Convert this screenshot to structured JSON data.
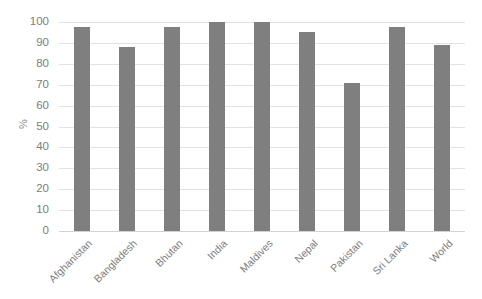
{
  "chart_data": {
    "type": "bar",
    "title": "",
    "subtitle": "",
    "xlabel": "",
    "ylabel": "%",
    "ylim": [
      0,
      100
    ],
    "ytick_step": 10,
    "yticks": [
      "100",
      "90",
      "80",
      "70",
      "60",
      "50",
      "40",
      "30",
      "20",
      "10",
      "0"
    ],
    "grid": true,
    "legend": false,
    "legend_position": "none",
    "bar_color": "#7f7f7f",
    "gridline_color": "#e2e2e2",
    "tick_label_color": "#7d7d7d",
    "categories": [
      "Afghanistan",
      "Bangladesh",
      "Bhutan",
      "India",
      "Maldives",
      "Nepal",
      "Pakistan",
      "Sri Lanka",
      "World"
    ],
    "values": [
      97.5,
      88,
      97.5,
      100,
      100,
      95,
      71,
      97.5,
      89
    ],
    "series": [
      {
        "name": "",
        "values": [
          97.5,
          88,
          97.5,
          100,
          100,
          95,
          71,
          97.5,
          89
        ]
      }
    ],
    "annotations": []
  }
}
